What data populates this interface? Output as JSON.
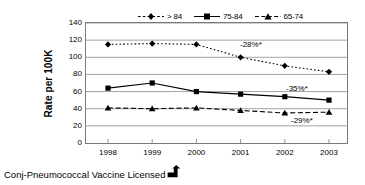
{
  "chart_data": {
    "type": "line",
    "title": "",
    "subtitle": "",
    "xlabel": "",
    "ylabel": "Rate per 100K",
    "categories": [
      "1998",
      "1999",
      "2000",
      "2001",
      "2002",
      "2003"
    ],
    "x": [
      1998,
      1999,
      2000,
      2001,
      2002,
      2003
    ],
    "ylim": [
      0,
      140
    ],
    "ytick_step": 20,
    "yticks": [
      0,
      20,
      40,
      60,
      80,
      100,
      120,
      140
    ],
    "ytick_labels": [
      "0",
      "20",
      "40",
      "60",
      "80",
      "100",
      "120",
      "140"
    ],
    "grid": "horizontal",
    "legend_position": "top-center",
    "series": [
      {
        "name": "> 84",
        "values": [
          115,
          116,
          115,
          100,
          90,
          83
        ],
        "marker": "diamond",
        "line_style": "dotted",
        "color": "#000000"
      },
      {
        "name": "75-84",
        "values": [
          64,
          70,
          60,
          57,
          54,
          50
        ],
        "marker": "square",
        "line_style": "solid",
        "color": "#000000"
      },
      {
        "name": "65-74",
        "values": [
          41,
          40,
          41,
          38,
          35,
          36
        ],
        "marker": "triangle",
        "line_style": "dashed",
        "color": "#000000"
      }
    ],
    "annotations": [
      {
        "text": "-28%*",
        "series": "> 84",
        "x_px": 240,
        "y_px": 40
      },
      {
        "text": "-35%*",
        "series": "75-84",
        "x_px": 286,
        "y_px": 84
      },
      {
        "text": "-29%*",
        "series": "65-74",
        "x_px": 291,
        "y_px": 116
      }
    ]
  },
  "footnote": {
    "text": "Conj-Pneumococcal Vaccine Licensed",
    "marker_icon": "up-arrow-icon"
  },
  "colors": {
    "axis": "#7a7a7a",
    "grid": "#8c8c8c",
    "ink": "#000000",
    "background": "#ffffff"
  }
}
